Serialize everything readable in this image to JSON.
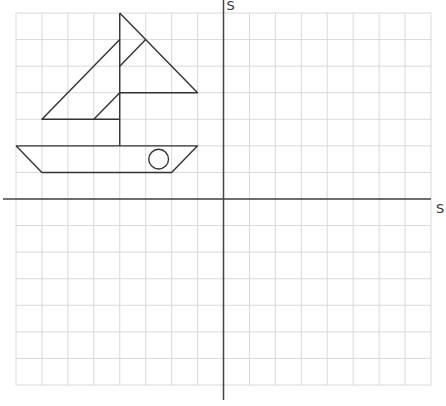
{
  "diagram": {
    "grid": {
      "columns": 16,
      "rows": 14
    },
    "axes": {
      "vertical_label": "S",
      "horizontal_label": "S",
      "vertical_axis_column": 8,
      "horizontal_axis_row": 7
    },
    "colors": {
      "grid": "#d9d9d9",
      "axis": "#444444",
      "shape": "#333333"
    },
    "shape": {
      "name": "sailboat",
      "segments": [
        {
          "name": "mast",
          "points": [
            [
              4,
              0
            ],
            [
              4,
              5
            ]
          ]
        },
        {
          "name": "right-sail-outline",
          "points": [
            [
              4,
              0
            ],
            [
              7,
              3
            ],
            [
              4,
              3
            ]
          ]
        },
        {
          "name": "right-sail-inner-line",
          "points": [
            [
              4,
              2
            ],
            [
              5,
              1
            ]
          ]
        },
        {
          "name": "left-sail-outline",
          "points": [
            [
              4,
              1
            ],
            [
              1,
              4
            ],
            [
              4,
              4
            ]
          ]
        },
        {
          "name": "left-sail-inner-line",
          "points": [
            [
              3,
              4
            ],
            [
              4,
              3
            ]
          ]
        },
        {
          "name": "hull",
          "points": [
            [
              0,
              5
            ],
            [
              7,
              5
            ],
            [
              6,
              6
            ],
            [
              1,
              6
            ],
            [
              0,
              5
            ]
          ]
        }
      ],
      "porthole": {
        "center": [
          5.5,
          5.5
        ],
        "radius_cells": 0.38
      }
    }
  }
}
